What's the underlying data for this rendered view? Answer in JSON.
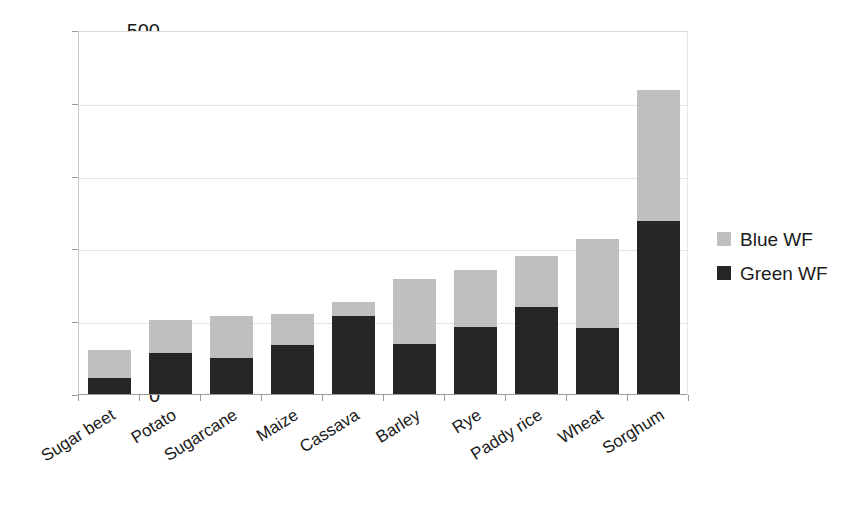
{
  "chart_data": {
    "type": "bar",
    "stacked": true,
    "title": "",
    "subtitle": "",
    "xlabel": "",
    "ylabel": "",
    "ylim": [
      0,
      500
    ],
    "y_ticks": [
      0,
      100,
      200,
      300,
      400,
      500
    ],
    "y_tick_labels": [
      "0",
      "100",
      "200",
      "300",
      "400",
      "500"
    ],
    "grid": true,
    "legend_position": "right",
    "categories": [
      "Sugar beet",
      "Potato",
      "Sugarcane",
      "Maize",
      "Cassava",
      "Barley",
      "Rye",
      "Paddy rice",
      "Wheat",
      "Sorghum"
    ],
    "series": [
      {
        "name": "Green WF",
        "color": "#262626",
        "values": [
          22,
          57,
          50,
          68,
          107,
          69,
          92,
          120,
          90,
          238
        ]
      },
      {
        "name": "Blue WF",
        "color": "#bfbfbf",
        "values": [
          38,
          45,
          57,
          42,
          19,
          89,
          79,
          70,
          123,
          180
        ]
      }
    ],
    "totals": [
      60,
      102,
      107,
      110,
      126,
      158,
      171,
      190,
      213,
      418
    ]
  },
  "legend": {
    "entries": [
      {
        "label": "Blue WF",
        "color": "#bfbfbf"
      },
      {
        "label": "Green WF",
        "color": "#262626"
      }
    ]
  }
}
